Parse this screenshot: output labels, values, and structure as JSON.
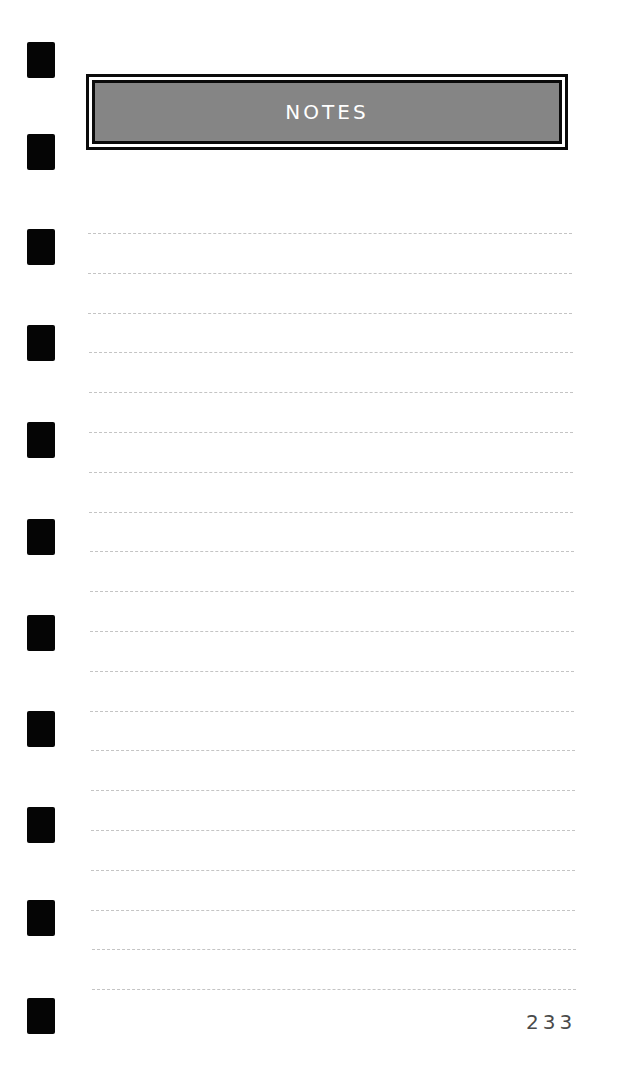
{
  "header": {
    "title": "NOTES"
  },
  "page": {
    "number": "233"
  },
  "binder_holes": {
    "count": 11,
    "tops": [
      42,
      134,
      229,
      325,
      422,
      519,
      615,
      711,
      807,
      900,
      998
    ]
  },
  "ruled_lines": {
    "count": 20,
    "first_y": 233,
    "spacing": 39.8
  },
  "colors": {
    "header_fill": "#858585",
    "border": "#0a0a0a",
    "rule": "#c4c4c4",
    "text": "#4a4a4a"
  }
}
